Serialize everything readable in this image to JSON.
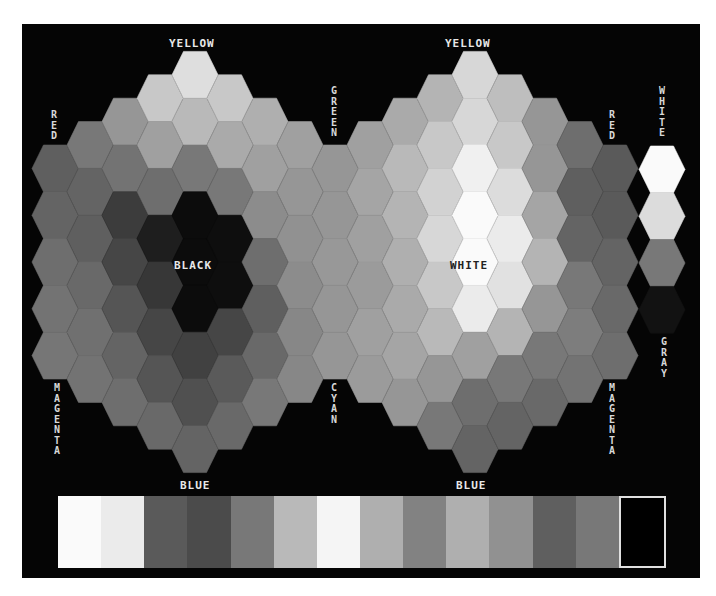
{
  "diagram": {
    "background": "#050505",
    "hex": {
      "pitch_x": 35,
      "pitch_y": 46.8,
      "size": 23
    },
    "clusters": [
      {
        "name": "left-cluster",
        "center_label": "BLACK",
        "center": [
          195,
          262
        ],
        "columns": [
          {
            "x": 55,
            "grays": [
              95,
              100,
              110,
              115,
              118
            ]
          },
          {
            "x": 90,
            "grays": [
              120,
              100,
              95,
              105,
              112,
              115
            ]
          },
          {
            "x": 125,
            "grays": [
              150,
              115,
              60,
              70,
              85,
              100,
              110
            ]
          },
          {
            "x": 160,
            "grays": [
              200,
              160,
              110,
              30,
              55,
              70,
              85,
              105
            ]
          },
          {
            "x": 195,
            "grays": [
              222,
              185,
              120,
              12,
              12,
              12,
              65,
              80,
              100
            ]
          },
          {
            "x": 230,
            "grays": [
              200,
              170,
              120,
              14,
              14,
              70,
              90,
              105
            ]
          },
          {
            "x": 265,
            "grays": [
              175,
              160,
              140,
              110,
              95,
              105,
              120
            ]
          },
          {
            "x": 300,
            "grays": [
              160,
              150,
              145,
              140,
              135,
              135
            ]
          },
          {
            "x": 335,
            "grays": [
              150,
              150,
              152,
              150,
              150
            ]
          }
        ]
      },
      {
        "name": "right-cluster",
        "center_label": "WHITE",
        "center": [
          475,
          262
        ],
        "columns": [
          {
            "x": 370,
            "grays": [
              160,
              165,
              160,
              155,
              160,
              155
            ]
          },
          {
            "x": 405,
            "grays": [
              170,
              185,
              180,
              175,
              170,
              165,
              150
            ]
          },
          {
            "x": 440,
            "grays": [
              180,
              200,
              210,
              215,
              200,
              185,
              150,
              120
            ]
          },
          {
            "x": 475,
            "grays": [
              215,
              215,
              240,
              250,
              250,
              235,
              160,
              110,
              100
            ]
          },
          {
            "x": 510,
            "grays": [
              190,
              200,
              220,
              235,
              225,
              180,
              120,
              100
            ]
          },
          {
            "x": 545,
            "grays": [
              150,
              150,
              165,
              180,
              150,
              120,
              105
            ]
          },
          {
            "x": 580,
            "grays": [
              110,
              95,
              100,
              120,
              125,
              115
            ]
          },
          {
            "x": 615,
            "grays": [
              90,
              90,
              100,
              105,
              110
            ]
          }
        ]
      }
    ],
    "gray_scale": {
      "x": 662,
      "top": 146,
      "grays": [
        250,
        220,
        120,
        18
      ]
    },
    "labels": {
      "left_top": "YELLOW",
      "right_top": "YELLOW",
      "left_red": "RED",
      "right_red": "RED",
      "middle_top": "GREEN",
      "middle_bottom": "CYAN",
      "left_magenta": "MAGENTA",
      "right_magenta": "MAGENTA",
      "left_bottom": "BLUE",
      "right_bottom": "BLUE",
      "left_center": "BLACK",
      "right_center": "WHITE",
      "gray_top": "WHITE",
      "gray_bottom": "GRAY"
    },
    "palette": [
      250,
      235,
      90,
      75,
      120,
      185,
      245,
      175,
      130,
      175,
      145,
      95,
      120,
      0
    ]
  }
}
